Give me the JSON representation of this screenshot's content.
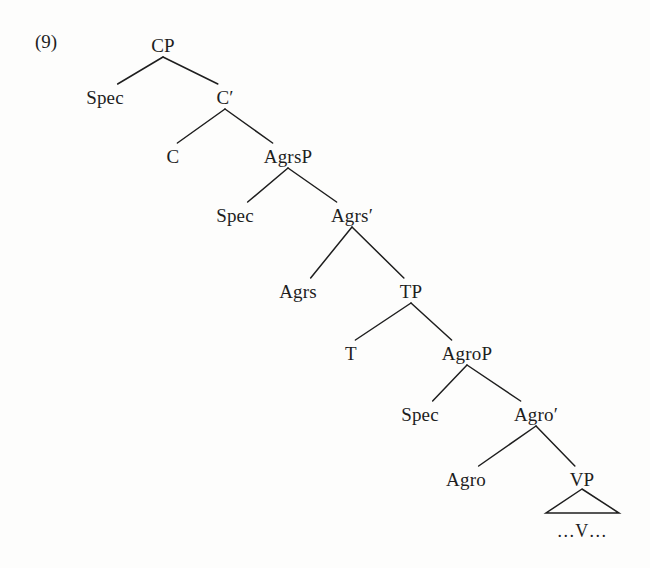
{
  "example": {
    "number_label": "(9)"
  },
  "diagram": {
    "type": "syntax-tree",
    "background_color": "#fdfdfc",
    "line_color": "#1e1e1e",
    "text_color": "#1e1e1e",
    "nodes": [
      {
        "id": "cp",
        "label": "CP",
        "x": 163,
        "y": 45
      },
      {
        "id": "spec1",
        "label": "Spec",
        "x": 105,
        "y": 97
      },
      {
        "id": "cbar",
        "label": "C′",
        "x": 225,
        "y": 97
      },
      {
        "id": "c",
        "label": "C",
        "x": 173,
        "y": 156
      },
      {
        "id": "agrsp",
        "label": "AgrsP",
        "x": 288,
        "y": 156
      },
      {
        "id": "spec2",
        "label": "Spec",
        "x": 235,
        "y": 215
      },
      {
        "id": "agrsbar",
        "label": "Agrs′",
        "x": 352,
        "y": 215
      },
      {
        "id": "agrs",
        "label": "Agrs",
        "x": 298,
        "y": 291
      },
      {
        "id": "tp",
        "label": "TP",
        "x": 411,
        "y": 291
      },
      {
        "id": "t",
        "label": "T",
        "x": 351,
        "y": 353
      },
      {
        "id": "agrop",
        "label": "AgroP",
        "x": 467,
        "y": 353
      },
      {
        "id": "spec3",
        "label": "Spec",
        "x": 420,
        "y": 414
      },
      {
        "id": "agrobar",
        "label": "Agro′",
        "x": 536,
        "y": 414
      },
      {
        "id": "agro",
        "label": "Agro",
        "x": 466,
        "y": 479
      },
      {
        "id": "vp",
        "label": "VP",
        "x": 582,
        "y": 479
      }
    ],
    "branches": [
      {
        "parent": "cp",
        "children": [
          "spec1",
          "cbar"
        ]
      },
      {
        "parent": "cbar",
        "children": [
          "c",
          "agrsp"
        ]
      },
      {
        "parent": "agrsp",
        "children": [
          "spec2",
          "agrsbar"
        ]
      },
      {
        "parent": "agrsbar",
        "children": [
          "agrs",
          "tp"
        ]
      },
      {
        "parent": "tp",
        "children": [
          "t",
          "agrop"
        ]
      },
      {
        "parent": "agrop",
        "children": [
          "spec3",
          "agrobar"
        ]
      },
      {
        "parent": "agrobar",
        "children": [
          "agro",
          "vp"
        ]
      }
    ],
    "triangle": {
      "parent": "vp",
      "apex_x": 582,
      "apex_y": 489,
      "base_left_x": 546,
      "base_right_x": 619,
      "base_y": 513,
      "terminal_label": "…V…",
      "terminal_x": 582,
      "terminal_y": 531
    }
  }
}
